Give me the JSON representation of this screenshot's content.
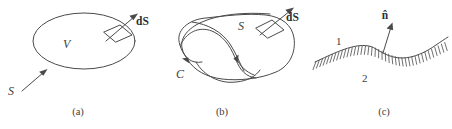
{
  "figure": {
    "background_color": "#ffffff",
    "line_color": "#4a4a4a",
    "panels": [
      {
        "id": "a",
        "caption": "(a)",
        "description": "closed-surface-volume",
        "labels": {
          "volume": "V",
          "surface": "S",
          "area_element": "dS"
        }
      },
      {
        "id": "b",
        "caption": "(b)",
        "description": "open-surface-bounded-by-curve",
        "labels": {
          "surface": "S",
          "boundary_curve": "C",
          "area_element": "dS"
        }
      },
      {
        "id": "c",
        "caption": "(c)",
        "description": "interface-between-two-media",
        "labels": {
          "region_one": "1",
          "region_two": "2",
          "normal": "n̂"
        }
      }
    ]
  }
}
